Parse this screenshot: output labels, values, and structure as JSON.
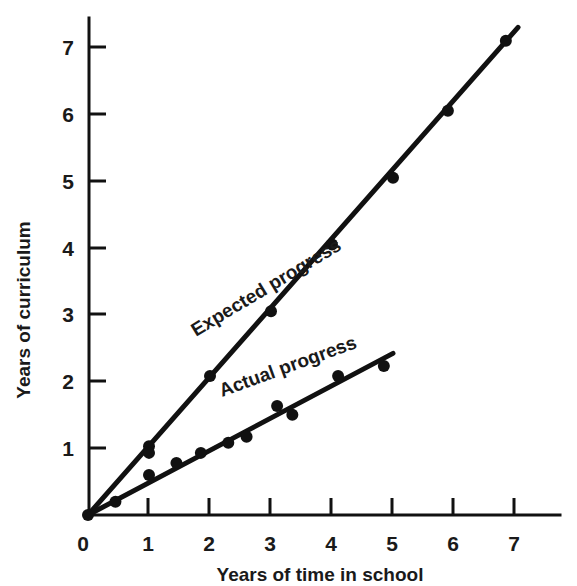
{
  "chart_data": {
    "type": "scatter",
    "title": "",
    "xlabel": "Years of time in school",
    "ylabel": "Years of curriculum",
    "xlim": [
      0,
      7.6
    ],
    "ylim": [
      0,
      7.4
    ],
    "xticks": [
      0,
      1,
      2,
      3,
      4,
      5,
      6,
      7
    ],
    "yticks": [
      0,
      1,
      2,
      3,
      4,
      5,
      6,
      7
    ],
    "xtick_labels": [
      "0",
      "1",
      "2",
      "3",
      "4",
      "5",
      "6",
      "7"
    ],
    "ytick_labels": [
      "0",
      "1",
      "2",
      "3",
      "4",
      "5",
      "6",
      "7"
    ],
    "grid": false,
    "legend_position": "inline-annotation",
    "series": [
      {
        "name": "Expected progress",
        "label": "Expected progress",
        "label_rotation_deg": -31,
        "color": "#111111",
        "line_width": 5,
        "marker": "circle",
        "marker_size": 9,
        "points": [
          {
            "x": 0.0,
            "y": 0.0
          },
          {
            "x": 1.0,
            "y": 1.03
          },
          {
            "x": 2.0,
            "y": 2.08
          },
          {
            "x": 3.0,
            "y": 3.05
          },
          {
            "x": 4.0,
            "y": 4.05
          },
          {
            "x": 5.0,
            "y": 5.05
          },
          {
            "x": 5.9,
            "y": 6.05
          },
          {
            "x": 6.85,
            "y": 7.1
          }
        ],
        "line_from": {
          "x": 0.0,
          "y": 0.0
        },
        "line_to": {
          "x": 7.05,
          "y": 7.3
        }
      },
      {
        "name": "Actual progress",
        "label": "Actual progress",
        "label_rotation_deg": -20,
        "color": "#111111",
        "line_width": 5,
        "marker": "circle",
        "marker_size": 9,
        "points": [
          {
            "x": 0.45,
            "y": 0.2
          },
          {
            "x": 1.0,
            "y": 0.6
          },
          {
            "x": 1.0,
            "y": 0.93
          },
          {
            "x": 1.45,
            "y": 0.78
          },
          {
            "x": 1.85,
            "y": 0.93
          },
          {
            "x": 2.3,
            "y": 1.08
          },
          {
            "x": 2.6,
            "y": 1.17
          },
          {
            "x": 3.1,
            "y": 1.63
          },
          {
            "x": 3.35,
            "y": 1.5
          },
          {
            "x": 4.1,
            "y": 2.08
          },
          {
            "x": 4.85,
            "y": 2.23
          }
        ],
        "line_from": {
          "x": 0.0,
          "y": 0.0
        },
        "line_to": {
          "x": 5.0,
          "y": 2.42
        }
      }
    ]
  },
  "axes": {
    "x_title": "Years of time in school",
    "y_title": "Years of curriculum",
    "origin_label": "0"
  }
}
